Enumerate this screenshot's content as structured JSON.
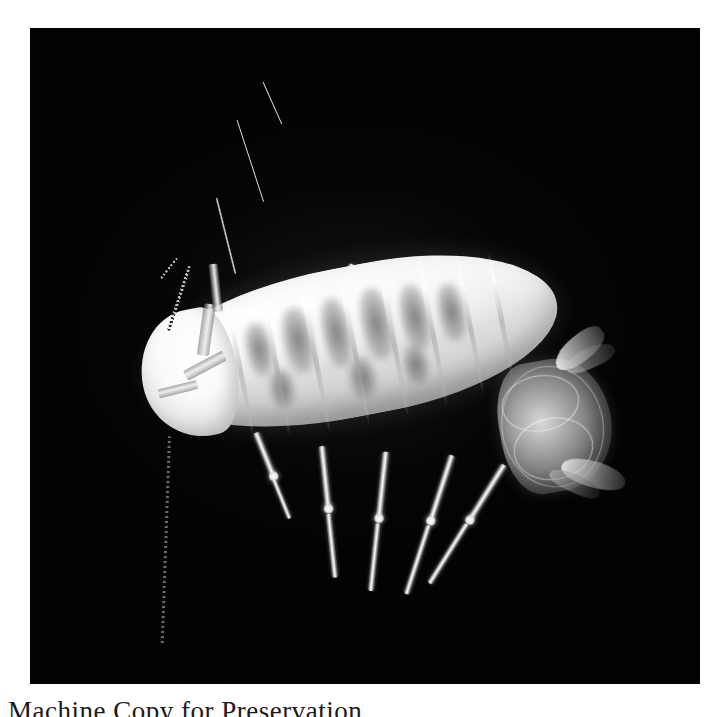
{
  "page": {
    "background_color": "#ffffff",
    "width": 727,
    "height": 717
  },
  "plate": {
    "name": "specimen-photograph",
    "background_color": "#030303",
    "left": 30,
    "top": 28,
    "width": 670,
    "height": 656,
    "subject": "pale isopod crustacean specimen, dorsal view",
    "alt_text": "Macro photograph of a translucent whitish isopod with segmented body, seven pairs of legs, long segmented antennae and paired uropods, photographed against a solid black background."
  },
  "specimen": {
    "body_label": "pereon",
    "head_label": "cephalon",
    "tail_label": "pleotelson",
    "segment_count": 8,
    "leg_pair_count": 7,
    "antenna_count": 2,
    "body_color": "#f2f2f2",
    "blotch_color": "#606060",
    "joint_color": "#ffffff"
  },
  "caption": {
    "text": "Machine Copy for Preservation",
    "color": "#1a1a1a"
  }
}
